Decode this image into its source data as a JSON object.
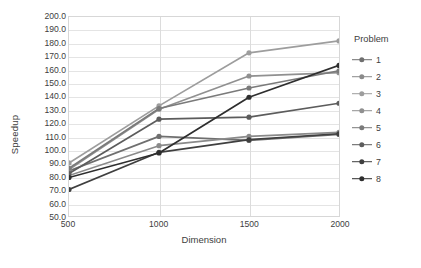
{
  "chart_data": {
    "type": "line",
    "title": "",
    "xlabel": "Dimension",
    "ylabel": "Speedup",
    "x": [
      500,
      1000,
      1500,
      2000
    ],
    "xticklabels": [
      "500",
      "1000",
      "1500",
      "2000"
    ],
    "ylim": [
      50.0,
      200.0
    ],
    "ytick_step": 10.0,
    "yticklabels": [
      "200.0",
      "190.0",
      "180.0",
      "170.0",
      "160.0",
      "150.0",
      "140.0",
      "130.0",
      "120.0",
      "110.0",
      "100.0",
      "90.0",
      "80.0",
      "70.0",
      "60.0",
      "50.0"
    ],
    "grid": true,
    "grid_axis": "both",
    "legend_title": "Problem",
    "legend_position": "right",
    "marker": "circle",
    "series": [
      {
        "name": "1",
        "values": [
          84.0,
          110.0,
          107.0,
          111.5
        ],
        "color": "#6f6f6f"
      },
      {
        "name": "2",
        "values": [
          80.5,
          103.0,
          110.0,
          113.0
        ],
        "color": "#8a8a8a"
      },
      {
        "name": "3",
        "values": [
          90.0,
          133.0,
          173.0,
          182.0
        ],
        "color": "#9d9d9d"
      },
      {
        "name": "4",
        "values": [
          85.0,
          130.5,
          155.5,
          158.0
        ],
        "color": "#909090"
      },
      {
        "name": "5",
        "values": [
          86.0,
          131.0,
          146.5,
          159.5
        ],
        "color": "#7a7a7a"
      },
      {
        "name": "6",
        "values": [
          82.0,
          123.0,
          124.5,
          135.0
        ],
        "color": "#5c5c5c"
      },
      {
        "name": "7",
        "values": [
          70.0,
          98.0,
          107.5,
          112.0
        ],
        "color": "#3f3f3f"
      },
      {
        "name": "8",
        "values": [
          79.0,
          97.5,
          139.5,
          163.5
        ],
        "color": "#2e2e2e"
      }
    ]
  },
  "axes": {
    "y_title": "Speedup",
    "x_title": "Dimension"
  },
  "legend": {
    "title": "Problem",
    "items": [
      {
        "label": "1"
      },
      {
        "label": "2"
      },
      {
        "label": "3"
      },
      {
        "label": "4"
      },
      {
        "label": "5"
      },
      {
        "label": "6"
      },
      {
        "label": "7"
      },
      {
        "label": "8"
      }
    ]
  },
  "colors": {
    "gridline": "#e4e4e4",
    "plot_border": "#d7d7d7",
    "text": "#404040",
    "background": "#ffffff"
  }
}
